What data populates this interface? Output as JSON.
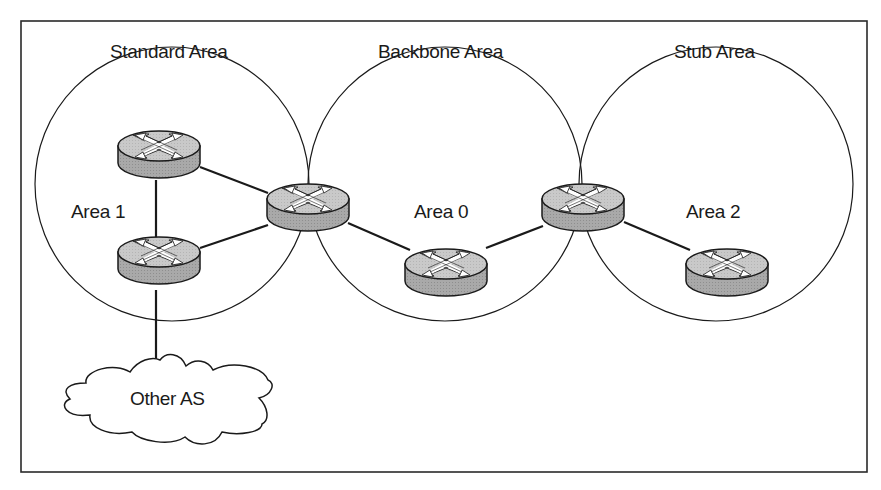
{
  "diagram": {
    "type": "network-topology",
    "title_labels": {
      "standard": "Standard Area",
      "backbone": "Backbone Area",
      "stub": "Stub Area"
    },
    "area_labels": {
      "area1": "Area 1",
      "area0": "Area 0",
      "area2": "Area 2"
    },
    "external": {
      "cloud_label": "Other AS"
    },
    "colors": {
      "line": "#1a1a1a",
      "router_top": "#c8c8c8",
      "router_side": "#a8a8a8",
      "arrow": "#ffffff",
      "background": "#ffffff"
    },
    "routers": [
      {
        "id": "r1",
        "area": "Area 1",
        "role": "internal"
      },
      {
        "id": "r2",
        "area": "Area 1",
        "role": "ASBR"
      },
      {
        "id": "r3",
        "area": "Area 1 / Area 0",
        "role": "ABR"
      },
      {
        "id": "r4",
        "area": "Area 0",
        "role": "backbone"
      },
      {
        "id": "r5",
        "area": "Area 0 / Area 2",
        "role": "ABR"
      },
      {
        "id": "r6",
        "area": "Area 2",
        "role": "internal"
      }
    ],
    "links": [
      [
        "r1",
        "r2"
      ],
      [
        "r1",
        "r3"
      ],
      [
        "r2",
        "r3"
      ],
      [
        "r3",
        "r4"
      ],
      [
        "r4",
        "r5"
      ],
      [
        "r5",
        "r6"
      ],
      [
        "r2",
        "Other AS"
      ]
    ]
  }
}
